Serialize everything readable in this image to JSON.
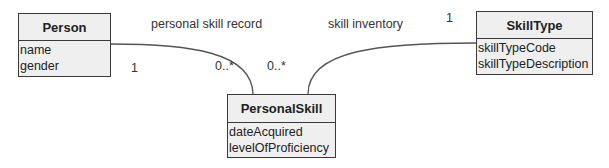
{
  "diagram": {
    "type": "UML class diagram",
    "classes": [
      {
        "name": "Person",
        "attributes": [
          "name",
          "gender"
        ]
      },
      {
        "name": "SkillType",
        "attributes": [
          "skillTypeCode",
          "skillTypeDescription"
        ]
      },
      {
        "name": "PersonalSkill",
        "attributes": [
          "dateAcquired",
          "levelOfProficiency"
        ]
      }
    ],
    "associations": [
      {
        "label": "personal skill record",
        "from": "Person",
        "to": "PersonalSkill",
        "from_multiplicity": "1",
        "to_multiplicity": "0..*"
      },
      {
        "label": "skill inventory",
        "from": "SkillType",
        "to": "PersonalSkill",
        "from_multiplicity": "1",
        "to_multiplicity": "0..*"
      }
    ],
    "colors": {
      "box_fill": "#efefef",
      "box_border": "#3a3a3a",
      "line": "#555555",
      "text": "#222222"
    }
  }
}
